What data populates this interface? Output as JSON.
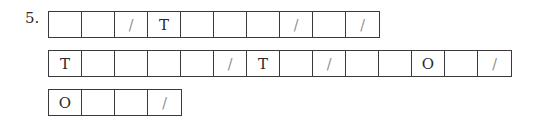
{
  "problem": {
    "number_label": "5.",
    "rows": [
      [
        "",
        "",
        "/",
        "T",
        "",
        "",
        "",
        "/",
        "",
        "/"
      ],
      [
        "T",
        "",
        "",
        "",
        "",
        "/",
        "T",
        "",
        "/",
        "",
        "",
        "O",
        "",
        "/"
      ],
      [
        "O",
        "",
        "",
        "/"
      ]
    ]
  }
}
